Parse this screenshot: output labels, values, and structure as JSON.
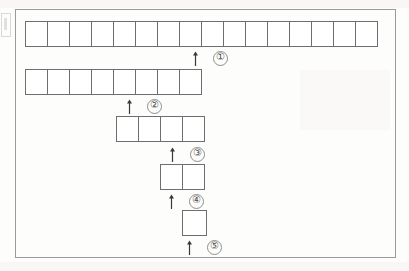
{
  "diagram": {
    "frame": {
      "border_color": "#9a9a9a"
    },
    "cell_border_color": "#6e6e6e",
    "paper_color": "#fdfdfc",
    "edge_artifact": {
      "name": "left-page-edge-mark"
    },
    "rows": [
      {
        "id": "row-1",
        "cell_count": 16,
        "cell_width": 23,
        "cell_height": 26,
        "left": 25,
        "top": 21,
        "marker": {
          "label": "①",
          "plain_label": "1",
          "arrow": "up-arrow",
          "arrow_left": 192,
          "arrow_top": 50
        }
      },
      {
        "id": "row-2",
        "cell_count": 8,
        "cell_width": 23,
        "cell_height": 26,
        "left": 25,
        "top": 69,
        "marker": {
          "label": "②",
          "plain_label": "2",
          "arrow": "up-arrow",
          "arrow_left": 126,
          "arrow_top": 98
        }
      },
      {
        "id": "row-3",
        "cell_count": 4,
        "cell_width": 23,
        "cell_height": 26,
        "left": 116,
        "top": 116,
        "marker": {
          "label": "③",
          "plain_label": "3",
          "arrow": "up-arrow",
          "arrow_left": 169,
          "arrow_top": 146
        }
      },
      {
        "id": "row-4",
        "cell_count": 2,
        "cell_width": 23,
        "cell_height": 26,
        "left": 160,
        "top": 164,
        "marker": {
          "label": "④",
          "plain_label": "4",
          "arrow": "up-arrow",
          "arrow_left": 168,
          "arrow_top": 193
        }
      },
      {
        "id": "row-5",
        "cell_count": 1,
        "cell_width": 25,
        "cell_height": 26,
        "left": 182,
        "top": 210,
        "marker": {
          "label": "⑤",
          "plain_label": "5",
          "arrow": "up-arrow",
          "arrow_left": 186,
          "arrow_top": 239
        }
      }
    ]
  }
}
